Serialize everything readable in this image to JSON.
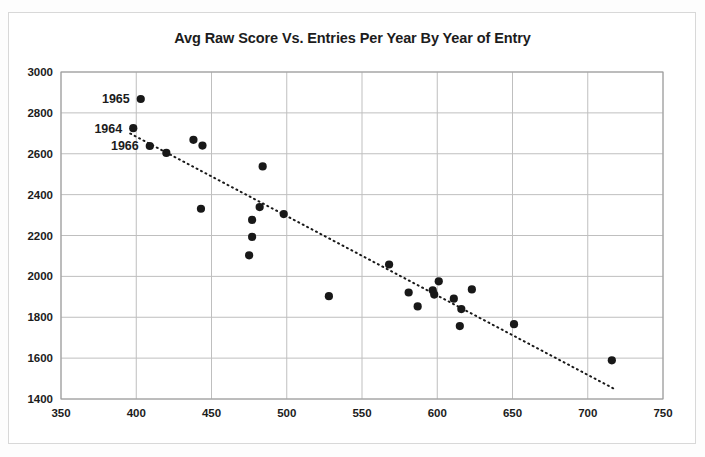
{
  "chart_data": {
    "type": "scatter",
    "title": "Avg Raw Score Vs. Entries Per Year By Year of Entry",
    "xlabel": "",
    "ylabel": "",
    "xlim": [
      350,
      750
    ],
    "ylim": [
      1400,
      3000
    ],
    "xticks": [
      350,
      400,
      450,
      500,
      550,
      600,
      650,
      700,
      750
    ],
    "yticks": [
      1400,
      1600,
      1800,
      2000,
      2200,
      2400,
      2600,
      2800,
      3000
    ],
    "grid": true,
    "legend": "none",
    "series": [
      {
        "name": "Avg Raw Score",
        "marker": "filled-circle",
        "color": "#181818",
        "points": [
          {
            "x": 403,
            "y": 2868,
            "label": "1965"
          },
          {
            "x": 398,
            "y": 2725,
            "label": "1964"
          },
          {
            "x": 409,
            "y": 2638,
            "label": "1966"
          },
          {
            "x": 420,
            "y": 2604,
            "label": ""
          },
          {
            "x": 438,
            "y": 2668,
            "label": ""
          },
          {
            "x": 444,
            "y": 2640,
            "label": ""
          },
          {
            "x": 443,
            "y": 2331,
            "label": ""
          },
          {
            "x": 484,
            "y": 2538,
            "label": ""
          },
          {
            "x": 477,
            "y": 2276,
            "label": ""
          },
          {
            "x": 482,
            "y": 2339,
            "label": ""
          },
          {
            "x": 477,
            "y": 2193,
            "label": ""
          },
          {
            "x": 475,
            "y": 2103,
            "label": ""
          },
          {
            "x": 498,
            "y": 2305,
            "label": ""
          },
          {
            "x": 528,
            "y": 1903,
            "label": ""
          },
          {
            "x": 568,
            "y": 2058,
            "label": ""
          },
          {
            "x": 581,
            "y": 1921,
            "label": ""
          },
          {
            "x": 587,
            "y": 1853,
            "label": ""
          },
          {
            "x": 597,
            "y": 1932,
            "label": ""
          },
          {
            "x": 598,
            "y": 1911,
            "label": ""
          },
          {
            "x": 601,
            "y": 1976,
            "label": ""
          },
          {
            "x": 611,
            "y": 1891,
            "label": ""
          },
          {
            "x": 616,
            "y": 1840,
            "label": ""
          },
          {
            "x": 615,
            "y": 1757,
            "label": ""
          },
          {
            "x": 623,
            "y": 1936,
            "label": ""
          },
          {
            "x": 651,
            "y": 1766,
            "label": ""
          },
          {
            "x": 716,
            "y": 1589,
            "label": ""
          }
        ]
      }
    ],
    "trendline": {
      "type": "linear-dotted",
      "x_start": 396,
      "y_start": 2699,
      "x_end": 717,
      "y_end": 1452
    },
    "annotations": [
      {
        "text": "1965",
        "x": 403,
        "y": 2868,
        "position": "left"
      },
      {
        "text": "1964",
        "x": 398,
        "y": 2725,
        "position": "left"
      },
      {
        "text": "1966",
        "x": 409,
        "y": 2638,
        "position": "left"
      }
    ]
  }
}
